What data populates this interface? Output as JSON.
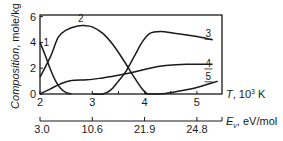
{
  "chart_data": {
    "type": "line",
    "title": "",
    "xlabel": "T, 10^3 K",
    "xlabel_main": "T",
    "xlabel_unit": ", 10",
    "xlabel_exp": "3",
    "xlabel_tail": " K",
    "ylabel": "Composition, mole/kg",
    "ylabel_italic": "Composition",
    "ylabel_unit": ", mole/kg",
    "secondary_xlabel": "E_v, eV/mol",
    "secondary_xlabel_main": "E",
    "secondary_xlabel_sub": "v",
    "secondary_xlabel_unit": ", eV/mol",
    "xlim": [
      2.0,
      5.45
    ],
    "ylim": [
      0,
      6.1
    ],
    "x_ticks": [
      2,
      3,
      4,
      5
    ],
    "x_tick_labels": [
      "2",
      "3",
      "4",
      "5"
    ],
    "x_minor_ticks": [
      3.5,
      4.5
    ],
    "y_ticks": [
      0,
      2,
      4,
      6
    ],
    "y_tick_labels": [
      "0",
      "2",
      "4",
      "6"
    ],
    "secondary_x_ticks": [
      2,
      3,
      4,
      5
    ],
    "secondary_x_tick_labels": [
      "3.0",
      "10.6",
      "21.9",
      "24.8"
    ],
    "grid": false,
    "legend": "inline curve labels",
    "series": [
      {
        "name": "1",
        "points": [
          [
            2.0,
            4.0
          ],
          [
            2.1,
            3.0
          ],
          [
            2.2,
            1.9
          ],
          [
            2.3,
            1.0
          ],
          [
            2.4,
            0.4
          ],
          [
            2.5,
            0.1
          ],
          [
            2.6,
            0.0
          ]
        ]
      },
      {
        "name": "2",
        "points": [
          [
            2.0,
            1.3
          ],
          [
            2.2,
            2.9
          ],
          [
            2.35,
            4.4
          ],
          [
            2.5,
            4.95
          ],
          [
            2.7,
            5.25
          ],
          [
            2.85,
            5.3
          ],
          [
            3.0,
            5.2
          ],
          [
            3.2,
            4.7
          ],
          [
            3.4,
            3.8
          ],
          [
            3.6,
            2.6
          ],
          [
            3.8,
            1.3
          ],
          [
            3.95,
            0.4
          ],
          [
            4.05,
            0.0
          ]
        ]
      },
      {
        "name": "3",
        "points": [
          [
            3.0,
            0.0
          ],
          [
            3.2,
            0.0
          ],
          [
            3.35,
            0.3
          ],
          [
            3.5,
            1.0
          ],
          [
            3.65,
            1.8
          ],
          [
            3.8,
            2.9
          ],
          [
            3.95,
            4.0
          ],
          [
            4.1,
            4.7
          ],
          [
            4.3,
            4.85
          ],
          [
            4.6,
            4.7
          ],
          [
            5.0,
            4.45
          ],
          [
            5.3,
            4.2
          ]
        ]
      },
      {
        "name": "4",
        "points": [
          [
            2.0,
            0.0
          ],
          [
            2.2,
            0.4
          ],
          [
            2.4,
            0.8
          ],
          [
            2.6,
            1.05
          ],
          [
            2.9,
            1.1
          ],
          [
            3.2,
            1.25
          ],
          [
            3.5,
            1.45
          ],
          [
            3.8,
            1.7
          ],
          [
            4.1,
            2.0
          ],
          [
            4.4,
            2.2
          ],
          [
            4.8,
            2.3
          ],
          [
            5.3,
            2.3
          ]
        ]
      },
      {
        "name": "5",
        "points": [
          [
            4.0,
            0.05
          ],
          [
            4.1,
            0.0
          ],
          [
            4.4,
            0.05
          ],
          [
            4.7,
            0.25
          ],
          [
            5.0,
            0.5
          ],
          [
            5.2,
            0.75
          ],
          [
            5.4,
            1.0
          ]
        ]
      }
    ],
    "curve_labels": [
      {
        "text": "1",
        "x": 2.12,
        "y": 3.7
      },
      {
        "text": "2",
        "x": 2.78,
        "y": 5.6
      },
      {
        "text": "3",
        "x": 5.22,
        "y": 4.4
      },
      {
        "text": "4",
        "x": 5.22,
        "y": 2.1
      },
      {
        "text": "5",
        "x": 5.22,
        "y": 1.1
      }
    ]
  },
  "colors": {
    "line": "#1a1a1a",
    "frame": "#1a1a1a",
    "background": "#ffffff"
  }
}
